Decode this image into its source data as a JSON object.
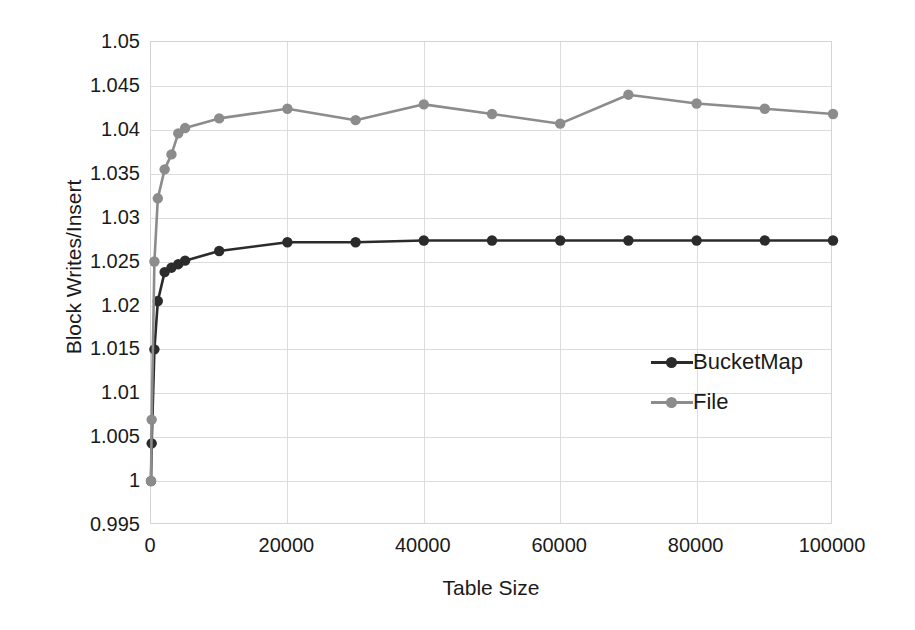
{
  "chart_data": {
    "type": "line",
    "title": "",
    "xlabel": "Table Size",
    "ylabel": "Block Writes/Insert",
    "xlim": [
      0,
      100000
    ],
    "ylim": [
      0.995,
      1.05
    ],
    "xticks": [
      "0",
      "20000",
      "40000",
      "60000",
      "80000",
      "100000"
    ],
    "xtick_values": [
      0,
      20000,
      40000,
      60000,
      80000,
      100000
    ],
    "yticks": [
      "1.05",
      "1.045",
      "1.04",
      "1.035",
      "1.03",
      "1.025",
      "1.02",
      "1.015",
      "1.01",
      "1.005",
      "1",
      "0.995"
    ],
    "ytick_values": [
      1.05,
      1.045,
      1.04,
      1.035,
      1.03,
      1.025,
      1.02,
      1.015,
      1.01,
      1.005,
      1.0,
      0.995
    ],
    "grid": true,
    "legend_position": "inside-right",
    "series": [
      {
        "name": "BucketMap",
        "color": "#2b2b2b",
        "x": [
          0,
          100,
          500,
          1000,
          2000,
          3000,
          4000,
          5000,
          10000,
          20000,
          30000,
          40000,
          50000,
          60000,
          70000,
          80000,
          90000,
          100000
        ],
        "values": [
          1.0,
          1.0043,
          1.015,
          1.0205,
          1.0238,
          1.0243,
          1.0247,
          1.0251,
          1.0262,
          1.0272,
          1.0272,
          1.0274,
          1.0274,
          1.0274,
          1.0274,
          1.0274,
          1.0274,
          1.0274
        ]
      },
      {
        "name": "File",
        "color": "#8c8c8c",
        "x": [
          0,
          100,
          500,
          1000,
          2000,
          3000,
          4000,
          5000,
          10000,
          20000,
          30000,
          40000,
          50000,
          60000,
          70000,
          80000,
          90000,
          100000
        ],
        "values": [
          1.0,
          1.007,
          1.025,
          1.0322,
          1.0355,
          1.0372,
          1.0396,
          1.0402,
          1.0413,
          1.0424,
          1.0411,
          1.0429,
          1.0418,
          1.0407,
          1.044,
          1.043,
          1.0424,
          1.0418
        ]
      }
    ]
  },
  "legend": {
    "items": [
      {
        "label": "BucketMap",
        "color": "#2b2b2b"
      },
      {
        "label": "File",
        "color": "#8c8c8c"
      }
    ]
  },
  "axes": {
    "x_title": "Table Size",
    "y_title": "Block Writes/Insert"
  }
}
